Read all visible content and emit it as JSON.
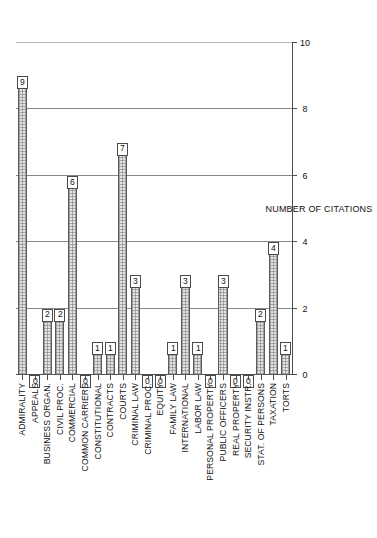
{
  "chart_data": {
    "type": "bar",
    "title": "",
    "xlabel": "",
    "ylabel": "NUMBER OF CITATIONS",
    "ylim": [
      0,
      10
    ],
    "y_ticks": [
      "0",
      "2",
      "4",
      "6",
      "8",
      "10"
    ],
    "grid": true,
    "orientation": "horizontal-rotated",
    "legend": "none",
    "categories": [
      "ADMIRALITY",
      "APPEALS",
      "BUSINESS ORGAN.",
      "CIVIL PROC.",
      "COMMERCIAL",
      "COMMON CARRIERS",
      "CONSTITUTIONAL",
      "CONTRACTS",
      "COURTS",
      "CRIMINAL LAW",
      "CRIMINAL PROC.",
      "EQUITY",
      "FAMILY LAW",
      "INTERNATIONAL",
      "LABOR LAW",
      "PERSONAL PROPERTY",
      "PUBLIC OFFICERS",
      "REAL PROPERTY",
      "SECURITY INSTR.",
      "STAT. OF PERSONS",
      "TAXATION",
      "TORTS"
    ],
    "values": [
      9,
      0,
      2,
      2,
      6,
      0,
      1,
      1,
      7,
      3,
      0,
      0,
      1,
      3,
      1,
      0,
      3,
      0,
      0,
      2,
      4,
      1
    ],
    "value_labels": [
      "9",
      "0",
      "2",
      "2",
      "6",
      "0",
      "1",
      "1",
      "7",
      "3",
      "0",
      "0",
      "1",
      "3",
      "1",
      "0",
      "3",
      "0",
      "0",
      "2",
      "4",
      "1"
    ]
  },
  "style": {
    "bar_fill": "#e3e3e3",
    "bar_edge": "#5a5a5a",
    "grid_color": "#8a8a8a",
    "axis_color": "#4d4d4d",
    "background": "#ffffff",
    "text_color": "#111111"
  }
}
